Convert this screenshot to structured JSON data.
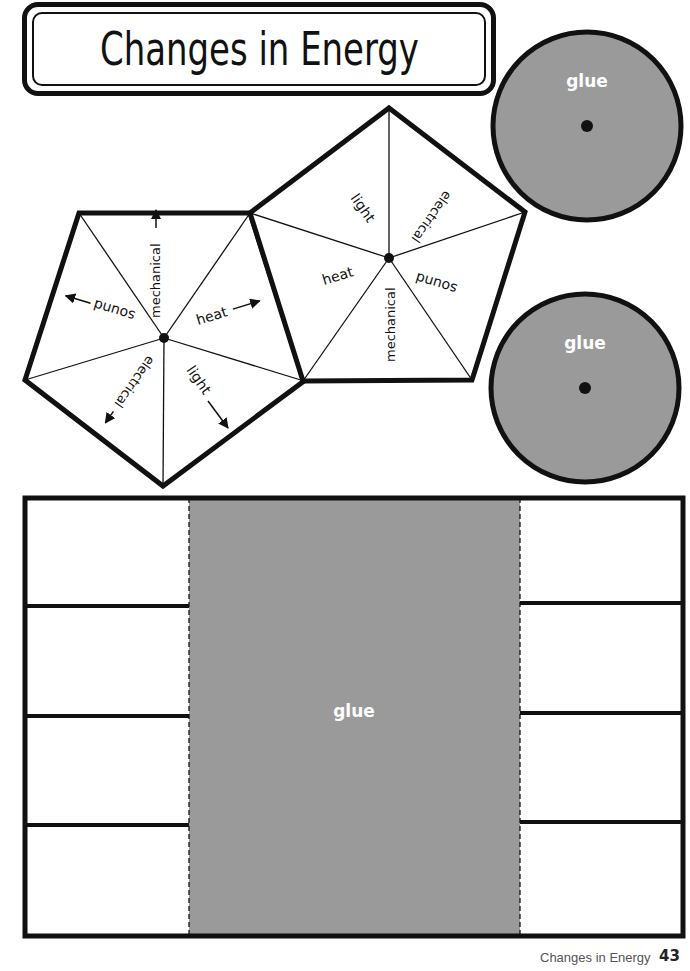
{
  "title": "Changes in Energy",
  "colors": {
    "glue_gray": "#9a9a9a",
    "line": "#111111",
    "glue_text": "#ffffff"
  },
  "glue_circles": [
    {
      "label": "glue"
    },
    {
      "label": "glue"
    }
  ],
  "left_pentagon": {
    "segments": [
      "mechanical",
      "heat",
      "light",
      "electrical",
      "sound"
    ]
  },
  "right_pentagon": {
    "segments": [
      "light",
      "electrical",
      "sound",
      "mechanical",
      "heat"
    ]
  },
  "flap_grid": {
    "glue_label": "glue",
    "left_rows": 4,
    "right_rows": 4
  },
  "footer": {
    "credit": "© Carson-Dellosa • CD-104908",
    "section_title": "Changes in Energy",
    "page_number": "43"
  }
}
